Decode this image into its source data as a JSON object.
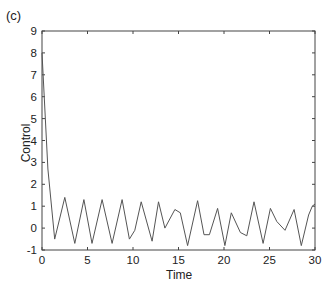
{
  "panel_label": "(c)",
  "chart_data": {
    "type": "line",
    "title": "",
    "xlabel": "Time",
    "ylabel": "Control",
    "xlim": [
      0,
      30
    ],
    "ylim": [
      -1,
      9
    ],
    "xticks": [
      0,
      5,
      10,
      15,
      20,
      25,
      30
    ],
    "yticks": [
      -1,
      0,
      1,
      2,
      3,
      4,
      5,
      6,
      7,
      8,
      9
    ],
    "grid": false,
    "legend": null,
    "series": [
      {
        "name": "control",
        "color": "#555555",
        "x": [
          0,
          0.65,
          1.4,
          2.5,
          3.6,
          4.6,
          5.5,
          6.6,
          7.7,
          8.8,
          9.6,
          10.2,
          10.9,
          12.1,
          12.8,
          13.5,
          14.6,
          15.2,
          16.0,
          17.1,
          17.8,
          18.4,
          19.3,
          20.1,
          20.8,
          21.8,
          22.5,
          23.3,
          24.3,
          25.1,
          25.8,
          26.7,
          27.7,
          28.5,
          29.3,
          29.7,
          30
        ],
        "y": [
          8.0,
          2.7,
          -0.5,
          1.4,
          -0.7,
          1.3,
          -0.7,
          1.3,
          -0.7,
          1.3,
          -0.5,
          -0.1,
          1.2,
          -0.6,
          1.2,
          0.0,
          0.85,
          0.7,
          -0.8,
          1.25,
          -0.3,
          -0.3,
          0.9,
          -0.8,
          0.7,
          -0.2,
          -0.35,
          1.2,
          -0.7,
          0.9,
          0.3,
          -0.1,
          0.85,
          -0.8,
          0.6,
          1.0,
          1.1
        ]
      }
    ]
  }
}
